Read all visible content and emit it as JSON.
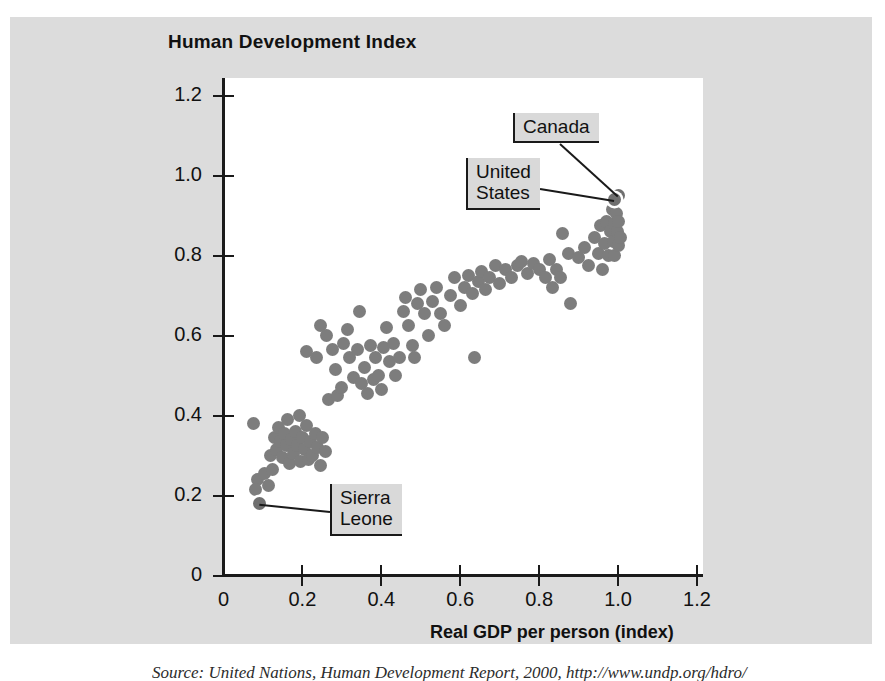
{
  "chart_data": {
    "type": "scatter",
    "title": "Human Development Index",
    "xlabel": "Real GDP per person (index)",
    "ylabel": "Human Development Index",
    "xlim": [
      0,
      1.2
    ],
    "ylim": [
      0,
      1.2
    ],
    "grid": false,
    "legend": null,
    "x_ticks": [
      "0",
      "0.2",
      "0.4",
      "0.6",
      "0.8",
      "1.0",
      "1.2"
    ],
    "x_tick_values": [
      0,
      0.2,
      0.4,
      0.6,
      0.8,
      1.0,
      1.2
    ],
    "y_ticks": [
      "0",
      "0.2",
      "0.4",
      "0.6",
      "0.8",
      "1.0",
      "1.2"
    ],
    "y_tick_values": [
      0,
      0.2,
      0.4,
      0.6,
      0.8,
      1.0,
      1.2
    ],
    "marker_color": "#7d7d7d",
    "points": [
      [
        0.075,
        0.38
      ],
      [
        0.085,
        0.24
      ],
      [
        0.082,
        0.215
      ],
      [
        0.09,
        0.185
      ],
      [
        0.105,
        0.255
      ],
      [
        0.115,
        0.225
      ],
      [
        0.12,
        0.3
      ],
      [
        0.125,
        0.265
      ],
      [
        0.13,
        0.345
      ],
      [
        0.135,
        0.315
      ],
      [
        0.14,
        0.37
      ],
      [
        0.145,
        0.335
      ],
      [
        0.15,
        0.295
      ],
      [
        0.155,
        0.355
      ],
      [
        0.16,
        0.325
      ],
      [
        0.163,
        0.39
      ],
      [
        0.168,
        0.28
      ],
      [
        0.172,
        0.34
      ],
      [
        0.178,
        0.305
      ],
      [
        0.182,
        0.36
      ],
      [
        0.188,
        0.325
      ],
      [
        0.192,
        0.4
      ],
      [
        0.196,
        0.285
      ],
      [
        0.2,
        0.345
      ],
      [
        0.205,
        0.315
      ],
      [
        0.21,
        0.375
      ],
      [
        0.215,
        0.29
      ],
      [
        0.22,
        0.335
      ],
      [
        0.225,
        0.3
      ],
      [
        0.232,
        0.355
      ],
      [
        0.238,
        0.32
      ],
      [
        0.245,
        0.275
      ],
      [
        0.25,
        0.345
      ],
      [
        0.258,
        0.31
      ],
      [
        0.265,
        0.44
      ],
      [
        0.21,
        0.56
      ],
      [
        0.235,
        0.545
      ],
      [
        0.245,
        0.625
      ],
      [
        0.26,
        0.6
      ],
      [
        0.275,
        0.565
      ],
      [
        0.285,
        0.515
      ],
      [
        0.29,
        0.45
      ],
      [
        0.3,
        0.47
      ],
      [
        0.305,
        0.58
      ],
      [
        0.315,
        0.615
      ],
      [
        0.32,
        0.545
      ],
      [
        0.33,
        0.495
      ],
      [
        0.34,
        0.565
      ],
      [
        0.345,
        0.66
      ],
      [
        0.35,
        0.48
      ],
      [
        0.358,
        0.52
      ],
      [
        0.365,
        0.455
      ],
      [
        0.372,
        0.575
      ],
      [
        0.38,
        0.49
      ],
      [
        0.385,
        0.545
      ],
      [
        0.392,
        0.5
      ],
      [
        0.4,
        0.465
      ],
      [
        0.405,
        0.57
      ],
      [
        0.412,
        0.62
      ],
      [
        0.42,
        0.535
      ],
      [
        0.43,
        0.58
      ],
      [
        0.435,
        0.5
      ],
      [
        0.445,
        0.545
      ],
      [
        0.455,
        0.66
      ],
      [
        0.46,
        0.695
      ],
      [
        0.47,
        0.625
      ],
      [
        0.478,
        0.575
      ],
      [
        0.485,
        0.545
      ],
      [
        0.492,
        0.68
      ],
      [
        0.5,
        0.715
      ],
      [
        0.51,
        0.655
      ],
      [
        0.52,
        0.6
      ],
      [
        0.53,
        0.685
      ],
      [
        0.54,
        0.72
      ],
      [
        0.55,
        0.655
      ],
      [
        0.56,
        0.625
      ],
      [
        0.575,
        0.7
      ],
      [
        0.585,
        0.745
      ],
      [
        0.6,
        0.675
      ],
      [
        0.61,
        0.72
      ],
      [
        0.62,
        0.75
      ],
      [
        0.63,
        0.705
      ],
      [
        0.635,
        0.545
      ],
      [
        0.645,
        0.735
      ],
      [
        0.655,
        0.76
      ],
      [
        0.665,
        0.715
      ],
      [
        0.675,
        0.745
      ],
      [
        0.69,
        0.775
      ],
      [
        0.7,
        0.73
      ],
      [
        0.715,
        0.765
      ],
      [
        0.73,
        0.745
      ],
      [
        0.745,
        0.775
      ],
      [
        0.755,
        0.785
      ],
      [
        0.77,
        0.755
      ],
      [
        0.785,
        0.78
      ],
      [
        0.8,
        0.765
      ],
      [
        0.815,
        0.745
      ],
      [
        0.825,
        0.79
      ],
      [
        0.835,
        0.72
      ],
      [
        0.845,
        0.765
      ],
      [
        0.855,
        0.745
      ],
      [
        0.86,
        0.855
      ],
      [
        0.875,
        0.805
      ],
      [
        0.88,
        0.68
      ],
      [
        0.9,
        0.795
      ],
      [
        0.915,
        0.82
      ],
      [
        0.925,
        0.775
      ],
      [
        0.94,
        0.845
      ],
      [
        0.95,
        0.805
      ],
      [
        0.955,
        0.875
      ],
      [
        0.96,
        0.765
      ],
      [
        0.965,
        0.83
      ],
      [
        0.97,
        0.885
      ],
      [
        0.975,
        0.8
      ],
      [
        0.98,
        0.86
      ],
      [
        0.985,
        0.915
      ],
      [
        0.988,
        0.835
      ],
      [
        0.99,
        0.88
      ],
      [
        0.992,
        0.8
      ],
      [
        0.995,
        0.905
      ],
      [
        0.998,
        0.86
      ],
      [
        1.0,
        0.825
      ],
      [
        1.002,
        0.885
      ],
      [
        1.005,
        0.845
      ]
    ],
    "annotations": [
      {
        "label": "Canada",
        "x": 1.0,
        "y": 0.95
      },
      {
        "label": "United\nStates",
        "x": 0.99,
        "y": 0.94
      },
      {
        "label": "Sierra\nLeone",
        "x": 0.09,
        "y": 0.18
      }
    ]
  },
  "source": {
    "text": "Source: United Nations, Human Development Report, 2000, http://www.undp.org/hdro/"
  }
}
